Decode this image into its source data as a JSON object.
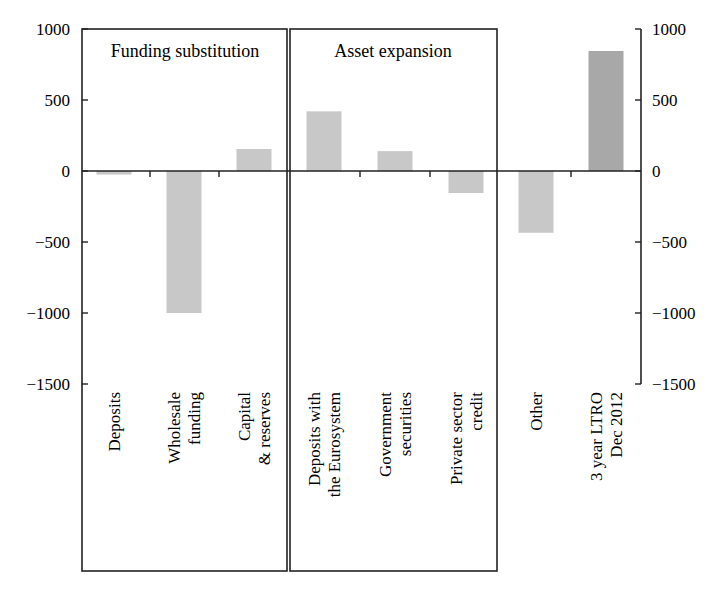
{
  "chart_data": {
    "type": "bar",
    "title": "",
    "xlabel": "",
    "ylabel": "",
    "ylim": [
      -1500,
      1000
    ],
    "yticks": [
      1000,
      500,
      0,
      -500,
      -1000,
      -1500
    ],
    "ytick_labels": [
      "1000",
      "500",
      "0",
      "−500",
      "−1000",
      "−1500"
    ],
    "grid": false,
    "legend": null,
    "categories": [
      "Deposits",
      "Wholesale funding",
      "Capital & reserves",
      "Deposits with the Eurosystem",
      "Government securities",
      "Private sector credit",
      "Other",
      "3 year LTRO Dec 2012"
    ],
    "category_label_lines": [
      [
        "Deposits"
      ],
      [
        "Wholesale",
        "funding"
      ],
      [
        "Capital",
        "& reserves"
      ],
      [
        "Deposits with",
        "the Eurosystem"
      ],
      [
        "Government",
        "securities"
      ],
      [
        "Private sector",
        "credit"
      ],
      [
        "Other"
      ],
      [
        "3 year LTRO",
        "Dec 2012"
      ]
    ],
    "values": [
      -25,
      -1000,
      155,
      420,
      140,
      -155,
      -435,
      845
    ],
    "bar_colors": [
      "#c8c8c8",
      "#c8c8c8",
      "#c8c8c8",
      "#c8c8c8",
      "#c8c8c8",
      "#c8c8c8",
      "#c8c8c8",
      "#a8a8a8"
    ],
    "groups": [
      {
        "label": "Funding substitution",
        "categories": [
          0,
          1,
          2
        ]
      },
      {
        "label": "Asset expansion",
        "categories": [
          3,
          4,
          5
        ]
      }
    ],
    "annotations": [
      "Funding substitution",
      "Asset expansion"
    ],
    "secondary_axis": {
      "position": "right",
      "ylim": [
        -1500,
        1000
      ],
      "ytick_labels": [
        "1000",
        "500",
        "0",
        "−500",
        "−1000",
        "−1500"
      ]
    }
  },
  "labels": {
    "group_funding": "Funding substitution",
    "group_asset": "Asset expansion"
  }
}
